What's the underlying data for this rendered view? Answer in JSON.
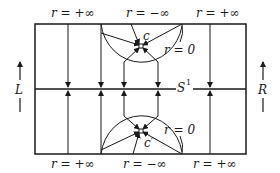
{
  "diagram": {
    "top_labels": [
      "r = +∞",
      "r = −∞",
      "r = +∞"
    ],
    "bottom_labels": [
      "r = +∞",
      "r = −∞",
      "r = +∞"
    ],
    "side_left": "L",
    "side_right": "R",
    "center_line_label": "S",
    "center_line_sup": "1",
    "top_point": "c",
    "bottom_point": "c′",
    "top_arc_label": "r = 0",
    "bottom_arc_label": "r = 0",
    "colors": {
      "stroke": "#1a1a1a",
      "background": "#ffffff"
    }
  }
}
